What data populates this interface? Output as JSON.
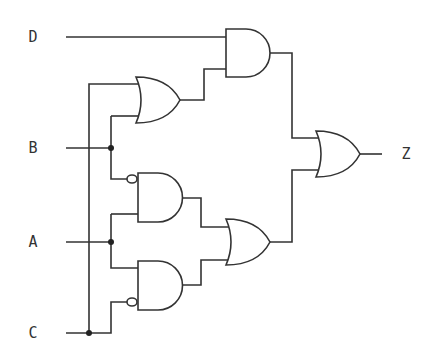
{
  "diagram": {
    "type": "logic-circuit",
    "inputs": [
      {
        "name": "D",
        "x": 33,
        "y": 37
      },
      {
        "name": "B",
        "x": 33,
        "y": 148
      },
      {
        "name": "A",
        "x": 33,
        "y": 242
      },
      {
        "name": "C",
        "x": 33,
        "y": 333
      }
    ],
    "output": {
      "name": "Z",
      "x": 406,
      "y": 154
    },
    "gates": [
      {
        "id": "or1",
        "type": "OR",
        "inputs": [
          "C",
          "B"
        ]
      },
      {
        "id": "and1",
        "type": "AND",
        "inputs": [
          "D",
          "or1"
        ]
      },
      {
        "id": "and2",
        "type": "AND",
        "inputs": [
          "NOT B",
          "A"
        ]
      },
      {
        "id": "and3",
        "type": "AND",
        "inputs": [
          "A",
          "NOT C"
        ]
      },
      {
        "id": "or2",
        "type": "OR",
        "inputs": [
          "and2",
          "and3"
        ]
      },
      {
        "id": "or3",
        "type": "OR",
        "inputs": [
          "and1",
          "or2"
        ],
        "output": "Z"
      }
    ],
    "colors": {
      "wire": "#333333",
      "background": "#ffffff"
    }
  }
}
